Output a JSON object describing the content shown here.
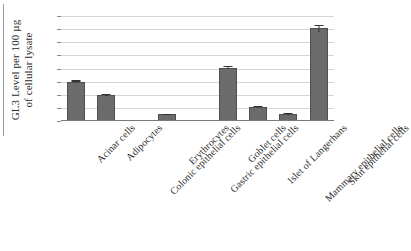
{
  "chart_data": {
    "type": "bar",
    "title": "",
    "xlabel": "",
    "ylabel": "GL3 Level per 100 µg of cellular lysate",
    "ylabel_lines": [
      "GL3 Level per 100 µg",
      "of cellular lysate"
    ],
    "ylim": [
      0,
      8
    ],
    "ytick_labels": [
      "8",
      "7",
      "6",
      "5",
      "4",
      "3",
      "2",
      "1",
      "0"
    ],
    "ytick_values": [
      8,
      7,
      6,
      5,
      4,
      3,
      2,
      1,
      0
    ],
    "grid": true,
    "legend": "none",
    "bar_color": "#6b6b6b",
    "bar_edge_color": "#4f4f4f",
    "gridline_color": "#d6d6d6",
    "axis_color": "#7a7a7a",
    "categories": [
      "Acinar cells",
      "Adipocytes",
      "Colonic epithelial cells",
      "Erythrocytes",
      "Gastric epithelial cells",
      "Goblet cells",
      "Islet of Langerhans",
      "Mammary epithelial cells",
      "Skin epithelial cells"
    ],
    "values": [
      3.0,
      2.0,
      0.0,
      0.5,
      0.0,
      4.05,
      1.05,
      0.55,
      7.05
    ],
    "errors": [
      0.1,
      0.07,
      0.0,
      0.05,
      0.0,
      0.12,
      0.07,
      0.06,
      0.3
    ]
  }
}
